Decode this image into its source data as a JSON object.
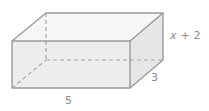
{
  "figure": {
    "name": "rectangular-prism-diagram",
    "shape": "rectangular prism",
    "background_color": "#ffffff",
    "edge_color": "#9a9a9f",
    "hidden_edge_color": "#a8a8ad",
    "label_color": "#8a8a8f",
    "faces": {
      "front_fill": "#ededed",
      "top_fill": "#f6f6f6",
      "right_fill": "#e6e6e6"
    },
    "labels": {
      "height": {
        "variable": "x",
        "operator": "+",
        "constant": "2",
        "full": "x + 2"
      },
      "depth": "3",
      "width": "5"
    },
    "geometry": {
      "front_top_left": [
        12,
        41
      ],
      "front_top_right": [
        130,
        41
      ],
      "front_bottom_right": [
        130,
        88
      ],
      "front_bottom_left": [
        12,
        88
      ],
      "back_top_left": [
        46,
        13
      ],
      "back_top_right": [
        163,
        13
      ],
      "back_bottom_right": [
        163,
        60
      ],
      "back_bottom_left": [
        46,
        60
      ]
    }
  }
}
